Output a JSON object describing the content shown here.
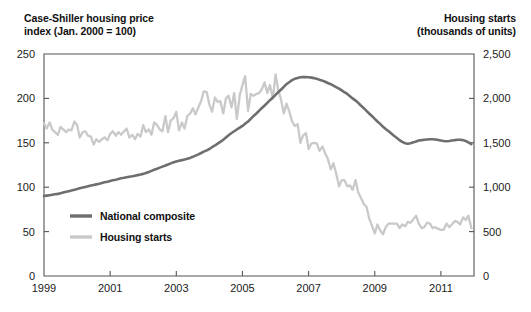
{
  "left_axis_title": "Case-Shiller housing price\nindex (Jan. 2000 = 100)",
  "right_axis_title": "Housing starts\n(thousands of units)",
  "legend": {
    "items": [
      {
        "label": "National composite",
        "color": "#6e6e6e"
      },
      {
        "label": "Housing starts",
        "color": "#c9c9c9"
      }
    ]
  },
  "chart_data": {
    "type": "line",
    "title": "",
    "subtitle": "",
    "xlabel": "",
    "ylabel": "Case-Shiller housing price index (Jan. 2000 = 100)",
    "y2label": "Housing starts (thousands of units)",
    "grid": false,
    "legend_position": "inside-lower-left",
    "xlim": [
      1999.0,
      2012.0
    ],
    "ylim": [
      0,
      250
    ],
    "y2lim": [
      0,
      2500
    ],
    "xticks": [
      1999,
      2001,
      2003,
      2005,
      2007,
      2009,
      2011
    ],
    "xtick_labels": [
      "1999",
      "2001",
      "2003",
      "2005",
      "2007",
      "2009",
      "2011"
    ],
    "yticks": [
      0,
      50,
      100,
      150,
      200,
      250
    ],
    "ytick_labels": [
      "0",
      "50",
      "100",
      "150",
      "200",
      "250"
    ],
    "y2ticks": [
      0,
      500,
      1000,
      1500,
      2000,
      2500
    ],
    "y2tick_labels": [
      "0",
      "500",
      "1,000",
      "1,500",
      "2,000",
      "2,500"
    ],
    "series": [
      {
        "name": "National composite",
        "color": "#6e6e6e",
        "axis": "left",
        "linewidth": 2.6,
        "x": [
          1999.0,
          1999.08,
          1999.17,
          1999.25,
          1999.33,
          1999.42,
          1999.5,
          1999.58,
          1999.67,
          1999.75,
          1999.83,
          1999.92,
          2000.0,
          2000.08,
          2000.17,
          2000.25,
          2000.33,
          2000.42,
          2000.5,
          2000.58,
          2000.67,
          2000.75,
          2000.83,
          2000.92,
          2001.0,
          2001.08,
          2001.17,
          2001.25,
          2001.33,
          2001.42,
          2001.5,
          2001.58,
          2001.67,
          2001.75,
          2001.83,
          2001.92,
          2002.0,
          2002.08,
          2002.17,
          2002.25,
          2002.33,
          2002.42,
          2002.5,
          2002.58,
          2002.67,
          2002.75,
          2002.83,
          2002.92,
          2003.0,
          2003.08,
          2003.17,
          2003.25,
          2003.33,
          2003.42,
          2003.5,
          2003.58,
          2003.67,
          2003.75,
          2003.83,
          2003.92,
          2004.0,
          2004.08,
          2004.17,
          2004.25,
          2004.33,
          2004.42,
          2004.5,
          2004.58,
          2004.67,
          2004.75,
          2004.83,
          2004.92,
          2005.0,
          2005.08,
          2005.17,
          2005.25,
          2005.33,
          2005.42,
          2005.5,
          2005.58,
          2005.67,
          2005.75,
          2005.83,
          2005.92,
          2006.0,
          2006.08,
          2006.17,
          2006.25,
          2006.33,
          2006.42,
          2006.5,
          2006.58,
          2006.67,
          2006.75,
          2006.83,
          2006.92,
          2007.0,
          2007.08,
          2007.17,
          2007.25,
          2007.33,
          2007.42,
          2007.5,
          2007.58,
          2007.67,
          2007.75,
          2007.83,
          2007.92,
          2008.0,
          2008.08,
          2008.17,
          2008.25,
          2008.33,
          2008.42,
          2008.5,
          2008.58,
          2008.67,
          2008.75,
          2008.83,
          2008.92,
          2009.0,
          2009.08,
          2009.17,
          2009.25,
          2009.33,
          2009.42,
          2009.5,
          2009.58,
          2009.67,
          2009.75,
          2009.83,
          2009.92,
          2010.0,
          2010.08,
          2010.17,
          2010.25,
          2010.33,
          2010.42,
          2010.5,
          2010.58,
          2010.67,
          2010.75,
          2010.83,
          2010.92,
          2011.0,
          2011.08,
          2011.17,
          2011.25,
          2011.33,
          2011.42,
          2011.5,
          2011.58,
          2011.67,
          2011.75,
          2011.83,
          2011.92
        ],
        "y": [
          90,
          90.5,
          91,
          91.5,
          92,
          92.5,
          93.2,
          94,
          94.8,
          95.5,
          96.2,
          97,
          98,
          98.8,
          99.6,
          100.3,
          101,
          101.8,
          102.5,
          103.2,
          104,
          104.8,
          105.5,
          106.2,
          107,
          107.8,
          108.5,
          109.2,
          110,
          110.6,
          111.2,
          111.8,
          112.4,
          113,
          113.6,
          114.2,
          115,
          116,
          117.2,
          118.4,
          119.6,
          120.8,
          122,
          123.2,
          124.4,
          125.6,
          126.8,
          128,
          129,
          129.8,
          130.5,
          131.2,
          132,
          133,
          134.2,
          135.5,
          137,
          138.5,
          140,
          141.5,
          143,
          145,
          147,
          149,
          151,
          153.5,
          156,
          158.5,
          161,
          163,
          165,
          167,
          169,
          171.5,
          174,
          177,
          180,
          183,
          186,
          189,
          192,
          195,
          198,
          201,
          204,
          207,
          210,
          213,
          216,
          218.5,
          220.5,
          222,
          223,
          223.8,
          224,
          224,
          223.8,
          223.4,
          222.8,
          222,
          221,
          220,
          218.8,
          217.4,
          216,
          214.4,
          212.8,
          211,
          209,
          207,
          205,
          202.5,
          200,
          197.5,
          195,
          192,
          189,
          186,
          183,
          180,
          177,
          174,
          171,
          168,
          165.5,
          163,
          160.5,
          158,
          155.5,
          153,
          151,
          149.5,
          149,
          149.5,
          150.5,
          151.5,
          152.5,
          153,
          153.5,
          153.8,
          154,
          154,
          153.8,
          153.2,
          152.5,
          152,
          151.8,
          152,
          152.5,
          153,
          153.5,
          153.5,
          153,
          152,
          150.5,
          148.5
        ]
      },
      {
        "name": "Housing starts",
        "color": "#c9c9c9",
        "axis": "right",
        "linewidth": 2.3,
        "x": [
          1999.0,
          1999.08,
          1999.17,
          1999.25,
          1999.33,
          1999.42,
          1999.5,
          1999.58,
          1999.67,
          1999.75,
          1999.83,
          1999.92,
          2000.0,
          2000.08,
          2000.17,
          2000.25,
          2000.33,
          2000.42,
          2000.5,
          2000.58,
          2000.67,
          2000.75,
          2000.83,
          2000.92,
          2001.0,
          2001.08,
          2001.17,
          2001.25,
          2001.33,
          2001.42,
          2001.5,
          2001.58,
          2001.67,
          2001.75,
          2001.83,
          2001.92,
          2002.0,
          2002.08,
          2002.17,
          2002.25,
          2002.33,
          2002.42,
          2002.5,
          2002.58,
          2002.67,
          2002.75,
          2002.83,
          2002.92,
          2003.0,
          2003.08,
          2003.17,
          2003.25,
          2003.33,
          2003.42,
          2003.5,
          2003.58,
          2003.67,
          2003.75,
          2003.83,
          2003.92,
          2004.0,
          2004.08,
          2004.17,
          2004.25,
          2004.33,
          2004.42,
          2004.5,
          2004.58,
          2004.67,
          2004.75,
          2004.83,
          2004.92,
          2005.0,
          2005.08,
          2005.17,
          2005.25,
          2005.33,
          2005.42,
          2005.5,
          2005.58,
          2005.67,
          2005.75,
          2005.83,
          2005.92,
          2006.0,
          2006.08,
          2006.17,
          2006.25,
          2006.33,
          2006.42,
          2006.5,
          2006.58,
          2006.67,
          2006.75,
          2006.83,
          2006.92,
          2007.0,
          2007.08,
          2007.17,
          2007.25,
          2007.33,
          2007.42,
          2007.5,
          2007.58,
          2007.67,
          2007.75,
          2007.83,
          2007.92,
          2008.0,
          2008.08,
          2008.17,
          2008.25,
          2008.33,
          2008.42,
          2008.5,
          2008.58,
          2008.67,
          2008.75,
          2008.83,
          2008.92,
          2009.0,
          2009.08,
          2009.17,
          2009.25,
          2009.33,
          2009.42,
          2009.5,
          2009.58,
          2009.67,
          2009.75,
          2009.83,
          2009.92,
          2010.0,
          2010.08,
          2010.17,
          2010.25,
          2010.33,
          2010.42,
          2010.5,
          2010.58,
          2010.67,
          2010.75,
          2010.83,
          2010.92,
          2011.0,
          2011.08,
          2011.17,
          2011.25,
          2011.33,
          2011.42,
          2011.5,
          2011.58,
          2011.67,
          2011.75,
          2011.83,
          2011.92
        ],
        "y": [
          1720,
          1660,
          1730,
          1650,
          1620,
          1590,
          1680,
          1650,
          1620,
          1650,
          1640,
          1740,
          1700,
          1560,
          1620,
          1630,
          1580,
          1570,
          1480,
          1540,
          1510,
          1540,
          1560,
          1530,
          1600,
          1630,
          1580,
          1620,
          1590,
          1630,
          1660,
          1560,
          1590,
          1540,
          1600,
          1570,
          1700,
          1620,
          1650,
          1590,
          1730,
          1700,
          1650,
          1630,
          1800,
          1620,
          1750,
          1780,
          1850,
          1640,
          1730,
          1660,
          1800,
          1830,
          1890,
          1820,
          1900,
          1970,
          2080,
          2070,
          1930,
          1850,
          2010,
          1960,
          1970,
          1830,
          2000,
          2030,
          1900,
          2060,
          1770,
          2040,
          2150,
          2250,
          1860,
          2050,
          2030,
          2050,
          2060,
          2100,
          2180,
          2060,
          2150,
          2000,
          2270,
          2100,
          1980,
          1830,
          1940,
          1850,
          1740,
          1690,
          1710,
          1500,
          1580,
          1610,
          1430,
          1490,
          1500,
          1490,
          1410,
          1460,
          1380,
          1320,
          1200,
          1270,
          1160,
          1010,
          1080,
          1080,
          1010,
          1020,
          970,
          1080,
          940,
          880,
          810,
          780,
          650,
          560,
          480,
          580,
          510,
          470,
          550,
          590,
          590,
          590,
          590,
          540,
          580,
          560,
          610,
          600,
          640,
          680,
          590,
          540,
          550,
          600,
          590,
          540,
          550,
          530,
          520,
          520,
          590,
          550,
          580,
          620,
          610,
          580,
          660,
          630,
          680,
          540
        ]
      }
    ]
  }
}
